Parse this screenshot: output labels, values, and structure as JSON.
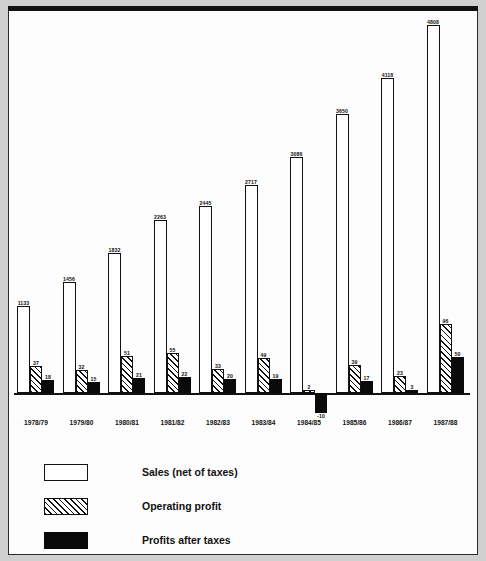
{
  "chart_data": {
    "type": "bar",
    "title": "",
    "subtitle": "",
    "xlabel": "",
    "ylabel": "",
    "grid": false,
    "legend_position": "bottom-left",
    "categories": [
      "1978/79",
      "1979/80",
      "1980/81",
      "1981/82",
      "1982/83",
      "1983/84",
      "1984/85",
      "1985/86",
      "1986/87",
      "1987/88"
    ],
    "ylim": [
      -10,
      4808
    ],
    "series": [
      {
        "name": "Sales (net of taxes)",
        "values": [
          1133,
          1456,
          1832,
          2263,
          2445,
          2717,
          3086,
          3650,
          4118,
          4808
        ]
      },
      {
        "name": "Operating profit",
        "values": [
          37,
          32,
          51,
          55,
          33,
          49,
          2,
          39,
          23,
          96
        ]
      },
      {
        "name": "Profits after taxes",
        "values": [
          18,
          15,
          21,
          22,
          20,
          19,
          -10,
          17,
          3,
          50
        ]
      }
    ],
    "annotations": [
      "1984/85 profits after taxes is negative (-10), drawn below the baseline"
    ]
  },
  "legend": {
    "items": [
      {
        "label": "Sales (net of taxes)",
        "swatch": "white-outline"
      },
      {
        "label": "Operating profit",
        "swatch": "hatched"
      },
      {
        "label": "Profits after taxes",
        "swatch": "solid-black"
      }
    ]
  },
  "colors": {
    "ink": "#111111",
    "paper": "#fdfdfd",
    "page": "#cfcfcf"
  }
}
